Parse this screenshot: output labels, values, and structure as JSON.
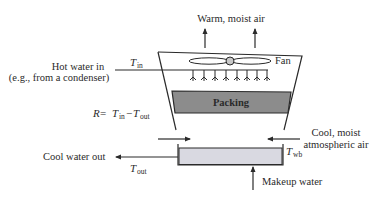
{
  "diagram": {
    "labels": {
      "warm_air": "Warm, moist air",
      "fan": "Fan",
      "hot_water_line1": "Hot water in",
      "hot_water_line2": "(e.g., from a condenser)",
      "t_in_main": "T",
      "t_in_sub": "in",
      "packing": "Packing",
      "range_R": "R",
      "range_eq": " = ",
      "range_t1": "T",
      "range_t1_sub": "in",
      "range_minus": "−",
      "range_t2": "T",
      "range_t2_sub": "out",
      "cool_air_line1": "Cool, moist",
      "cool_air_line2": "atmospheric air",
      "t_wb_main": "T",
      "t_wb_sub": "wb",
      "cool_water_out": "Cool water out",
      "t_out_main": "T",
      "t_out_sub": "out",
      "makeup_water": "Makeup water"
    },
    "colors": {
      "stroke": "#2a2a2a",
      "packing_fill": "#8c8c8c",
      "basin_fill": "#d9d9e1",
      "fan_hub": "#c8c8c8"
    }
  }
}
